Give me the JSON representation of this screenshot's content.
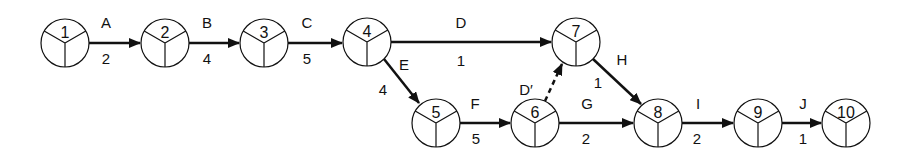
{
  "diagram": {
    "type": "activity-on-arrow network",
    "nodes": [
      {
        "id": "1",
        "x": 65,
        "y": 43
      },
      {
        "id": "2",
        "x": 165,
        "y": 43
      },
      {
        "id": "3",
        "x": 264,
        "y": 43
      },
      {
        "id": "4",
        "x": 367,
        "y": 42
      },
      {
        "id": "7",
        "x": 576,
        "y": 42
      },
      {
        "id": "5",
        "x": 436,
        "y": 123
      },
      {
        "id": "6",
        "x": 535,
        "y": 123
      },
      {
        "id": "8",
        "x": 658,
        "y": 123
      },
      {
        "id": "9",
        "x": 758,
        "y": 123
      },
      {
        "id": "10",
        "x": 846,
        "y": 123
      }
    ],
    "activities": [
      {
        "name": "A",
        "duration": "2",
        "from": "1",
        "to": "2",
        "dashed": false
      },
      {
        "name": "B",
        "duration": "4",
        "from": "2",
        "to": "3",
        "dashed": false
      },
      {
        "name": "C",
        "duration": "5",
        "from": "3",
        "to": "4",
        "dashed": false
      },
      {
        "name": "D",
        "duration": "1",
        "from": "4",
        "to": "7",
        "dashed": false
      },
      {
        "name": "E",
        "duration": "4",
        "from": "4",
        "to": "5",
        "dashed": false
      },
      {
        "name": "F",
        "duration": "5",
        "from": "5",
        "to": "6",
        "dashed": false
      },
      {
        "name": "D′",
        "duration": "",
        "from": "6",
        "to": "7",
        "dashed": true
      },
      {
        "name": "G",
        "duration": "2",
        "from": "6",
        "to": "8",
        "dashed": false
      },
      {
        "name": "H",
        "duration": "1",
        "from": "7",
        "to": "8",
        "dashed": false
      },
      {
        "name": "I",
        "duration": "2",
        "from": "8",
        "to": "9",
        "dashed": false
      },
      {
        "name": "J",
        "duration": "1",
        "from": "9",
        "to": "10",
        "dashed": false
      }
    ]
  },
  "labels": {
    "A": {
      "name": "A",
      "duration": "2"
    },
    "B": {
      "name": "B",
      "duration": "4"
    },
    "C": {
      "name": "C",
      "duration": "5"
    },
    "D": {
      "name": "D",
      "duration": "1"
    },
    "E": {
      "name": "E",
      "duration": "4"
    },
    "F": {
      "name": "F",
      "duration": "5"
    },
    "Dprime": {
      "name": "D′"
    },
    "G": {
      "name": "G",
      "duration": "2"
    },
    "H": {
      "name": "H",
      "duration": "1"
    },
    "I": {
      "name": "I",
      "duration": "2"
    },
    "J": {
      "name": "J",
      "duration": "1"
    },
    "n1": "1",
    "n2": "2",
    "n3": "3",
    "n4": "4",
    "n5": "5",
    "n6": "6",
    "n7": "7",
    "n8": "8",
    "n9": "9",
    "n10": "10"
  },
  "colors": {
    "stroke": "#111111",
    "background": "#ffffff"
  }
}
